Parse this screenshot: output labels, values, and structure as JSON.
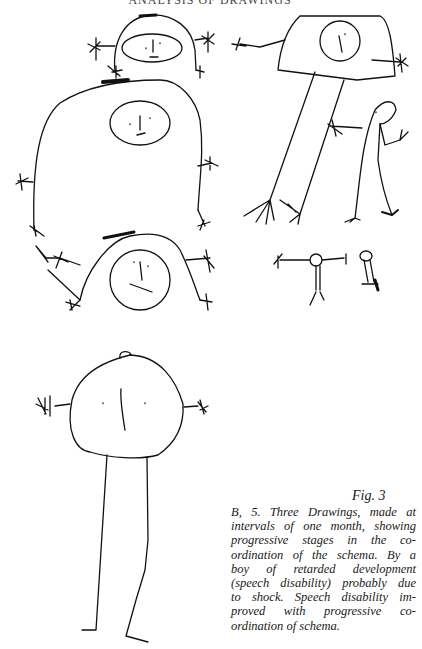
{
  "page": {
    "running_head": "ANALYSIS OF DRAWINGS"
  },
  "figure": {
    "label": "Fig. 3",
    "panels": [
      {
        "name": "drawing-first-month",
        "description": "three stacked human figures with round heads and spiky hands"
      },
      {
        "name": "drawing-second-month",
        "description": "square-headed figure with long legs and smaller companion figures"
      },
      {
        "name": "drawing-third-month",
        "description": "large round-headed figure with long straight legs"
      }
    ]
  },
  "caption": {
    "lines": [
      "B, 5. Three Drawings, made at",
      "intervals of one month, showing",
      "progressive stages in the co-",
      "ordination of the schema. By a",
      "boy of retarded development",
      "(speech disability) probably due",
      "to shock. Speech disability im-",
      "proved with progressive co-",
      "ordination of schema."
    ]
  }
}
